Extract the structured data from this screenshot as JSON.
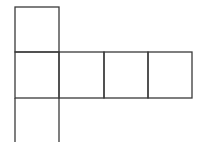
{
  "diagram": {
    "type": "cube-net",
    "stroke_color": "#3a3a3a",
    "background": "#ffffff",
    "cells": [
      {
        "row": 0,
        "col": 0
      },
      {
        "row": 1,
        "col": 0
      },
      {
        "row": 1,
        "col": 1
      },
      {
        "row": 1,
        "col": 2
      },
      {
        "row": 1,
        "col": 3
      },
      {
        "row": 2,
        "col": 0
      }
    ],
    "note": "bottom square is cropped at image edge"
  }
}
